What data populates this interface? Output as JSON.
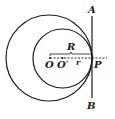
{
  "diagram": {
    "type": "geometry",
    "labels": {
      "A": "A",
      "B": "B",
      "P": "P",
      "O": "O",
      "O_prime": "O′",
      "R": "R",
      "r": "r"
    },
    "colors": {
      "stroke": "#1a1a1a",
      "background": "#ffffff"
    },
    "elements": [
      {
        "kind": "circle",
        "name": "outer-circle",
        "center": "O",
        "radius_label": "R"
      },
      {
        "kind": "circle",
        "name": "inner-circle",
        "center": "O′",
        "radius_label": "r"
      },
      {
        "kind": "line",
        "name": "tangent-line",
        "from": "A",
        "to": "B",
        "through": "P"
      },
      {
        "kind": "dashed-line",
        "name": "center-line",
        "through": [
          "O",
          "O′",
          "P"
        ]
      }
    ]
  }
}
